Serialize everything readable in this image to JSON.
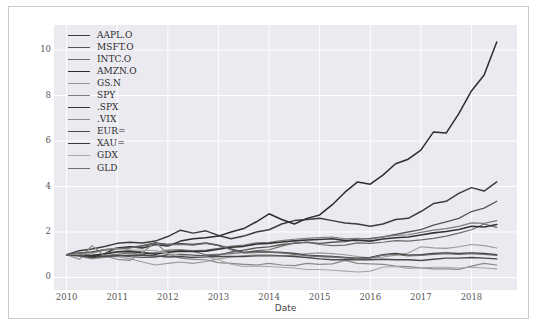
{
  "figure": {
    "background": "#ffffff",
    "border_color": "#c9c9c9",
    "plot_background": "#eaeaf0",
    "grid_color": "#ffffff"
  },
  "axes": {
    "xlabel": "Date",
    "ylabel": "",
    "ytick_labels": [
      "0",
      "2",
      "4",
      "6",
      "8",
      "10"
    ],
    "xtick_labels": [
      "2010",
      "2011",
      "2012",
      "2013",
      "2014",
      "2015",
      "2016",
      "2017",
      "2018"
    ]
  },
  "legend": {
    "position": "upper-left",
    "entries": [
      {
        "label": "AAPL.O",
        "color": "#3d3d3d",
        "width": 1.5
      },
      {
        "label": "MSFT.O",
        "color": "#555555",
        "width": 1.3
      },
      {
        "label": "INTC.O",
        "color": "#6b6b6b",
        "width": 1.2
      },
      {
        "label": "AMZN.O",
        "color": "#2e2e2e",
        "width": 1.5
      },
      {
        "label": "GS.N",
        "color": "#9a9a9a",
        "width": 1.1
      },
      {
        "label": "SPY",
        "color": "#7d7d7d",
        "width": 1.2
      },
      {
        "label": ".SPX",
        "color": "#343434",
        "width": 1.6
      },
      {
        "label": ".VIX",
        "color": "#8a8a8a",
        "width": 1.2
      },
      {
        "label": "EUR=",
        "color": "#4a4a4a",
        "width": 1.4
      },
      {
        "label": "XAU=",
        "color": "#3a3a3a",
        "width": 1.5
      },
      {
        "label": "GDX",
        "color": "#a8a8a8",
        "width": 1.1
      },
      {
        "label": "GLD",
        "color": "#6f6f6f",
        "width": 1.3
      }
    ]
  },
  "chart_data": {
    "type": "line",
    "title": "",
    "xlabel": "Date",
    "ylabel": "",
    "xlim": [
      2009.75,
      2018.9
    ],
    "ylim": [
      -0.55,
      11.1
    ],
    "grid": true,
    "legend_position": "upper-left",
    "note": "Normalized price index, all series start at 1.0 in January 2010",
    "x": [
      2010.0,
      2010.25,
      2010.5,
      2010.75,
      2011.0,
      2011.25,
      2011.5,
      2011.75,
      2012.0,
      2012.25,
      2012.5,
      2012.75,
      2013.0,
      2013.25,
      2013.5,
      2013.75,
      2014.0,
      2014.25,
      2014.5,
      2014.75,
      2015.0,
      2015.25,
      2015.5,
      2015.75,
      2016.0,
      2016.25,
      2016.5,
      2016.75,
      2017.0,
      2017.25,
      2017.5,
      2017.75,
      2018.0,
      2018.25,
      2018.5
    ],
    "series": [
      {
        "name": "AAPL.O",
        "color": "#3d3d3d",
        "values": [
          1.0,
          1.18,
          1.25,
          1.36,
          1.5,
          1.55,
          1.52,
          1.6,
          1.8,
          2.08,
          1.95,
          2.05,
          1.85,
          1.7,
          1.82,
          2.0,
          2.1,
          2.35,
          2.5,
          2.55,
          2.6,
          2.5,
          2.4,
          2.35,
          2.25,
          2.35,
          2.55,
          2.6,
          2.9,
          3.25,
          3.35,
          3.7,
          3.95,
          3.8,
          4.2
        ]
      },
      {
        "name": "MSFT.O",
        "color": "#555555",
        "values": [
          1.0,
          1.02,
          0.92,
          0.95,
          0.98,
          0.92,
          0.88,
          0.9,
          1.0,
          1.02,
          0.98,
          0.95,
          0.98,
          1.12,
          1.2,
          1.3,
          1.35,
          1.45,
          1.5,
          1.55,
          1.5,
          1.55,
          1.58,
          1.7,
          1.72,
          1.78,
          1.9,
          2.0,
          2.1,
          2.3,
          2.45,
          2.6,
          2.9,
          3.05,
          3.35
        ]
      },
      {
        "name": "INTC.O",
        "color": "#6b6b6b",
        "values": [
          1.0,
          1.05,
          0.9,
          0.95,
          1.02,
          1.08,
          1.0,
          1.1,
          1.2,
          1.22,
          1.15,
          1.0,
          1.02,
          1.05,
          1.1,
          1.18,
          1.22,
          1.38,
          1.52,
          1.55,
          1.45,
          1.4,
          1.42,
          1.52,
          1.5,
          1.55,
          1.62,
          1.6,
          1.65,
          1.72,
          1.82,
          1.95,
          2.1,
          2.35,
          2.2
        ]
      },
      {
        "name": "AMZN.O",
        "color": "#2e2e2e",
        "values": [
          1.0,
          1.0,
          0.9,
          1.05,
          1.3,
          1.35,
          1.3,
          1.45,
          1.38,
          1.6,
          1.7,
          1.75,
          1.82,
          2.0,
          2.15,
          2.45,
          2.8,
          2.55,
          2.35,
          2.6,
          2.75,
          3.2,
          3.75,
          4.2,
          4.1,
          4.5,
          5.0,
          5.2,
          5.6,
          6.4,
          6.35,
          7.2,
          8.2,
          8.9,
          10.35
        ]
      },
      {
        "name": "GS.N",
        "color": "#9a9a9a",
        "values": [
          1.0,
          0.92,
          0.82,
          0.88,
          0.92,
          0.82,
          0.68,
          0.55,
          0.62,
          0.68,
          0.62,
          0.7,
          0.82,
          0.9,
          0.95,
          1.0,
          1.0,
          0.95,
          0.98,
          1.05,
          1.08,
          1.05,
          1.0,
          0.92,
          0.85,
          0.9,
          0.98,
          1.08,
          1.35,
          1.3,
          1.28,
          1.35,
          1.45,
          1.4,
          1.3
        ]
      },
      {
        "name": "SPY",
        "color": "#7d7d7d",
        "values": [
          1.0,
          1.02,
          0.98,
          1.05,
          1.15,
          1.18,
          1.12,
          1.05,
          1.15,
          1.2,
          1.18,
          1.2,
          1.28,
          1.38,
          1.42,
          1.52,
          1.55,
          1.62,
          1.68,
          1.72,
          1.75,
          1.78,
          1.7,
          1.72,
          1.68,
          1.78,
          1.85,
          1.88,
          1.98,
          2.08,
          2.15,
          2.25,
          2.4,
          2.38,
          2.5
        ]
      },
      {
        "name": ".SPX",
        "color": "#343434",
        "values": [
          1.0,
          1.01,
          0.96,
          1.03,
          1.12,
          1.15,
          1.09,
          1.02,
          1.11,
          1.16,
          1.14,
          1.16,
          1.24,
          1.33,
          1.37,
          1.47,
          1.5,
          1.56,
          1.61,
          1.65,
          1.67,
          1.7,
          1.62,
          1.64,
          1.6,
          1.69,
          1.75,
          1.78,
          1.87,
          1.96,
          2.02,
          2.11,
          2.25,
          2.22,
          2.33
        ]
      },
      {
        "name": ".VIX",
        "color": "#8a8a8a",
        "values": [
          1.0,
          0.8,
          1.4,
          0.95,
          0.8,
          0.75,
          1.1,
          1.55,
          1.05,
          0.85,
          0.8,
          0.78,
          0.65,
          0.62,
          0.58,
          0.55,
          0.62,
          0.55,
          0.52,
          0.62,
          0.58,
          0.6,
          0.75,
          0.62,
          0.6,
          0.58,
          0.5,
          0.48,
          0.42,
          0.38,
          0.38,
          0.36,
          0.5,
          0.62,
          0.55
        ]
      },
      {
        "name": "EUR=",
        "color": "#4a4a4a",
        "values": [
          1.0,
          0.95,
          0.88,
          0.92,
          0.95,
          0.98,
          0.98,
          0.95,
          0.9,
          0.92,
          0.88,
          0.9,
          0.92,
          0.92,
          0.92,
          0.95,
          0.95,
          0.95,
          0.92,
          0.88,
          0.82,
          0.78,
          0.78,
          0.78,
          0.78,
          0.8,
          0.78,
          0.78,
          0.75,
          0.8,
          0.85,
          0.85,
          0.88,
          0.85,
          0.82
        ]
      },
      {
        "name": "XAU=",
        "color": "#3a3a3a",
        "values": [
          1.0,
          1.08,
          1.12,
          1.22,
          1.28,
          1.32,
          1.4,
          1.52,
          1.45,
          1.48,
          1.45,
          1.52,
          1.42,
          1.25,
          1.1,
          1.12,
          1.12,
          1.1,
          1.05,
          0.98,
          0.95,
          0.92,
          0.88,
          0.85,
          0.88,
          1.0,
          1.05,
          0.98,
          1.0,
          1.05,
          1.08,
          1.05,
          1.08,
          1.05,
          1.0
        ]
      },
      {
        "name": "GDX",
        "color": "#a8a8a8",
        "values": [
          1.0,
          1.02,
          1.05,
          1.22,
          1.28,
          1.22,
          1.2,
          1.18,
          1.05,
          0.98,
          0.92,
          0.9,
          0.78,
          0.58,
          0.48,
          0.5,
          0.48,
          0.45,
          0.42,
          0.35,
          0.35,
          0.32,
          0.28,
          0.24,
          0.28,
          0.45,
          0.48,
          0.4,
          0.42,
          0.45,
          0.45,
          0.42,
          0.45,
          0.42,
          0.38
        ]
      },
      {
        "name": "GLD",
        "color": "#6f6f6f",
        "values": [
          1.0,
          1.07,
          1.1,
          1.2,
          1.26,
          1.3,
          1.38,
          1.5,
          1.43,
          1.46,
          1.42,
          1.5,
          1.4,
          1.22,
          1.08,
          1.1,
          1.1,
          1.08,
          1.02,
          0.96,
          0.92,
          0.9,
          0.86,
          0.82,
          0.86,
          0.98,
          1.02,
          0.95,
          0.97,
          1.02,
          1.05,
          1.02,
          1.05,
          1.02,
          0.97
        ]
      }
    ]
  }
}
